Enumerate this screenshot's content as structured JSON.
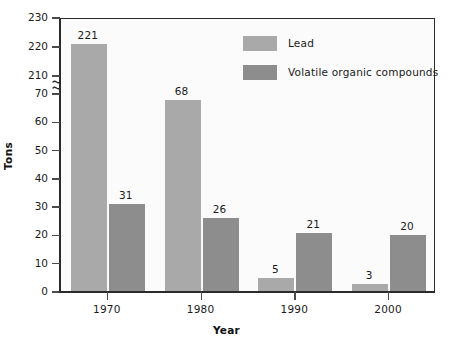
{
  "chart_data": {
    "type": "bar",
    "title": "",
    "subtitle": "",
    "xlabel": "Year",
    "ylabel": "Tons",
    "categories": [
      "1970",
      "1980",
      "1990",
      "2000"
    ],
    "series": [
      {
        "name": "Lead",
        "values": [
          221,
          68,
          5,
          3
        ],
        "color": "#a9a9a9"
      },
      {
        "name": "Volatile organic compounds",
        "values": [
          31,
          26,
          21,
          20
        ],
        "color": "#8d8d8d"
      }
    ],
    "value_labels": {
      "Lead": [
        "221",
        "68",
        "5",
        "3"
      ],
      "Volatile organic compounds": [
        "31",
        "26",
        "21",
        "20"
      ]
    },
    "yticks": [
      "0",
      "10",
      "20",
      "30",
      "40",
      "50",
      "60",
      "70",
      "210",
      "220",
      "230"
    ],
    "ylim": [
      0,
      230
    ],
    "y_axis_break": {
      "present": true,
      "from": 70,
      "to": 210,
      "symbol": "squiggle"
    },
    "grid": false,
    "legend_position": "top-right-inside",
    "legend_entries": [
      "Lead",
      "Volatile organic compounds"
    ],
    "background_color": "#fbfbfb",
    "axis_color": "#2b2b2b"
  },
  "axes": {
    "y_title": "Tons",
    "x_title": "Year"
  },
  "legend": {
    "items": [
      {
        "label": "Lead",
        "color": "#a9a9a9"
      },
      {
        "label": "Volatile organic compounds",
        "color": "#8d8d8d"
      }
    ]
  }
}
